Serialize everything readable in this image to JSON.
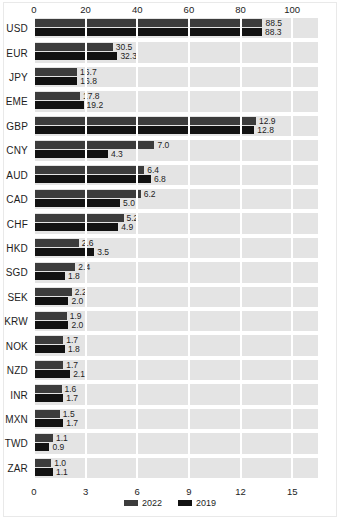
{
  "chart_data": {
    "type": "bar",
    "orientation": "horizontal",
    "title": "",
    "xlabel": "",
    "ylabel": "",
    "grid": true,
    "legend_position": "bottom-center",
    "legend": [
      "2022",
      "2019"
    ],
    "colors": {
      "y2022": "#3c3c3c",
      "y2019": "#121212",
      "band": "#e4e4e4",
      "gridline": "#ffffff",
      "background": "#ffffff"
    },
    "axes": [
      {
        "name": "top",
        "ticks": [
          0,
          20,
          40,
          60,
          80,
          100
        ],
        "tick_labels": [
          "0",
          "20",
          "40",
          "60",
          "80",
          "100"
        ],
        "lim": [
          0,
          110
        ],
        "applies_to": [
          "USD",
          "EUR",
          "JPY",
          "EME"
        ]
      },
      {
        "name": "bottom",
        "ticks": [
          0,
          3,
          6,
          9,
          12,
          15
        ],
        "tick_labels": [
          "0",
          "3",
          "6",
          "9",
          "12",
          "15"
        ],
        "lim": [
          0,
          16.5
        ],
        "applies_to": [
          "GBP",
          "CNY",
          "AUD",
          "CAD",
          "CHF",
          "HKD",
          "SGD",
          "SEK",
          "KRW",
          "NOK",
          "NZD",
          "INR",
          "MXN",
          "TWD",
          "ZAR"
        ]
      }
    ],
    "categories": [
      "USD",
      "EUR",
      "JPY",
      "EME",
      "GBP",
      "CNY",
      "AUD",
      "CAD",
      "CHF",
      "HKD",
      "SGD",
      "SEK",
      "KRW",
      "NOK",
      "NZD",
      "INR",
      "MXN",
      "TWD",
      "ZAR"
    ],
    "series": [
      {
        "name": "2022",
        "values": [
          88.5,
          30.5,
          16.7,
          17.8,
          12.9,
          7.0,
          6.4,
          6.2,
          5.2,
          2.6,
          2.4,
          2.2,
          1.9,
          1.7,
          1.7,
          1.6,
          1.5,
          1.1,
          1.0
        ]
      },
      {
        "name": "2019",
        "values": [
          88.3,
          32.3,
          16.8,
          19.2,
          12.8,
          4.3,
          6.8,
          5.0,
          4.9,
          3.5,
          1.8,
          2.0,
          2.0,
          1.8,
          2.1,
          1.7,
          1.7,
          0.9,
          1.1
        ]
      }
    ],
    "rows": [
      {
        "label": "USD",
        "axis": "top",
        "v2022": 88.5,
        "v2019": 88.3,
        "l2022": "88.5",
        "l2019": "88.3"
      },
      {
        "label": "EUR",
        "axis": "top",
        "v2022": 30.5,
        "v2019": 32.3,
        "l2022": "30.5",
        "l2019": "32.3"
      },
      {
        "label": "JPY",
        "axis": "top",
        "v2022": 16.7,
        "v2019": 16.8,
        "l2022": "16.7",
        "l2019": "16.8"
      },
      {
        "label": "EME",
        "axis": "top",
        "v2022": 17.8,
        "v2019": 19.2,
        "l2022": "17.8",
        "l2019": "19.2"
      },
      {
        "label": "GBP",
        "axis": "bottom",
        "v2022": 12.9,
        "v2019": 12.8,
        "l2022": "12.9",
        "l2019": "12.8"
      },
      {
        "label": "CNY",
        "axis": "bottom",
        "v2022": 7.0,
        "v2019": 4.3,
        "l2022": "7.0",
        "l2019": "4.3"
      },
      {
        "label": "AUD",
        "axis": "bottom",
        "v2022": 6.4,
        "v2019": 6.8,
        "l2022": "6.4",
        "l2019": "6.8"
      },
      {
        "label": "CAD",
        "axis": "bottom",
        "v2022": 6.2,
        "v2019": 5.0,
        "l2022": "6.2",
        "l2019": "5.0"
      },
      {
        "label": "CHF",
        "axis": "bottom",
        "v2022": 5.2,
        "v2019": 4.9,
        "l2022": "5.2",
        "l2019": "4.9"
      },
      {
        "label": "HKD",
        "axis": "bottom",
        "v2022": 2.6,
        "v2019": 3.5,
        "l2022": "2.6",
        "l2019": "3.5"
      },
      {
        "label": "SGD",
        "axis": "bottom",
        "v2022": 2.4,
        "v2019": 1.8,
        "l2022": "2.4",
        "l2019": "1.8"
      },
      {
        "label": "SEK",
        "axis": "bottom",
        "v2022": 2.2,
        "v2019": 2.0,
        "l2022": "2.2",
        "l2019": "2.0"
      },
      {
        "label": "KRW",
        "axis": "bottom",
        "v2022": 1.9,
        "v2019": 2.0,
        "l2022": "1.9",
        "l2019": "2.0"
      },
      {
        "label": "NOK",
        "axis": "bottom",
        "v2022": 1.7,
        "v2019": 1.8,
        "l2022": "1.7",
        "l2019": "1.8"
      },
      {
        "label": "NZD",
        "axis": "bottom",
        "v2022": 1.7,
        "v2019": 2.1,
        "l2022": "1.7",
        "l2019": "2.1"
      },
      {
        "label": "INR",
        "axis": "bottom",
        "v2022": 1.6,
        "v2019": 1.7,
        "l2022": "1.6",
        "l2019": "1.7"
      },
      {
        "label": "MXN",
        "axis": "bottom",
        "v2022": 1.5,
        "v2019": 1.7,
        "l2022": "1.5",
        "l2019": "1.7"
      },
      {
        "label": "TWD",
        "axis": "bottom",
        "v2022": 1.1,
        "v2019": 0.9,
        "l2022": "1.1",
        "l2019": "0.9"
      },
      {
        "label": "ZAR",
        "axis": "bottom",
        "v2022": 1.0,
        "v2019": 1.1,
        "l2022": "1.0",
        "l2019": "1.1"
      }
    ]
  }
}
